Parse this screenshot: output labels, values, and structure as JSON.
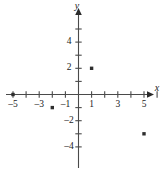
{
  "chart_data": {
    "type": "scatter",
    "title": "",
    "xlabel": "x",
    "ylabel": "y",
    "xlim": [
      -6.2,
      6.4
    ],
    "ylim": [
      -5.4,
      5.2
    ],
    "grid": false,
    "legend": null,
    "x_ticks": [
      -5,
      -4,
      -3,
      -2,
      -1,
      1,
      2,
      3,
      4,
      5,
      6
    ],
    "y_ticks": [
      -4,
      -3,
      -2,
      -1,
      1,
      2,
      3,
      4,
      5
    ],
    "x_tick_labels": [
      {
        "value": -5,
        "text": "–5"
      },
      {
        "value": -3,
        "text": "–3"
      },
      {
        "value": -1,
        "text": "–1"
      },
      {
        "value": 1,
        "text": "1"
      },
      {
        "value": 3,
        "text": "3"
      },
      {
        "value": 5,
        "text": "5"
      }
    ],
    "y_tick_labels": [
      {
        "value": 4,
        "text": "4"
      },
      {
        "value": 2,
        "text": "2"
      },
      {
        "value": -2,
        "text": "–2"
      },
      {
        "value": -4,
        "text": "–4"
      }
    ],
    "points": [
      {
        "x": -5,
        "y": 0,
        "label": ""
      },
      {
        "x": -2,
        "y": -1,
        "label": ""
      },
      {
        "x": 1,
        "y": 2,
        "label": ""
      },
      {
        "x": 5,
        "y": -3,
        "label": ""
      }
    ],
    "marker": "square",
    "marker_color": "#2e2e2e",
    "axis_color": "#4a4a4a"
  }
}
